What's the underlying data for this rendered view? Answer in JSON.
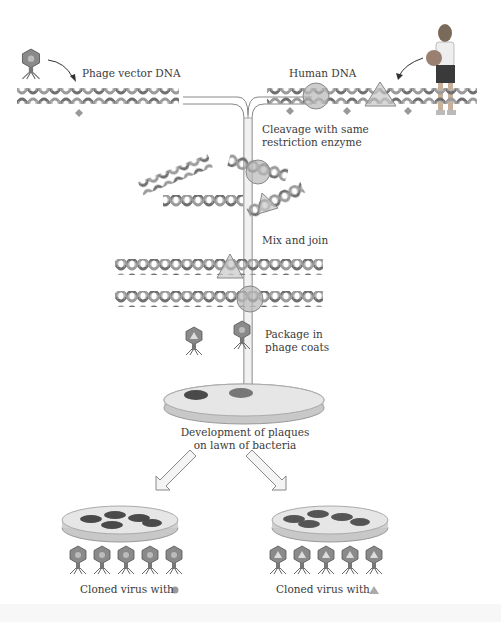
{
  "labels": {
    "phage_vector_dna": "Phage vector DNA",
    "human_dna": "Human DNA",
    "cleavage_line1": "Cleavage with same",
    "cleavage_line2": "restriction enzyme",
    "mix_and_join": "Mix and join",
    "package_line1": "Package in",
    "package_line2": "phage coats",
    "plaques_line1": "Development of plaques",
    "plaques_line2": "on lawn of bacteria",
    "cloned_circle": "Cloned virus with",
    "cloned_triangle": "Cloned virus with"
  },
  "markers": {
    "circle_insert": "circle-insert",
    "triangle_insert": "triangle-insert"
  },
  "colors": {
    "dna_strand": "#8a8a8a",
    "dna_dark": "#5a5a5a",
    "insert_fill": "#b8b8b8",
    "plaque": "#4a4a4a",
    "dish": "#d8d8d8",
    "arrow_outline": "#888888"
  },
  "counts": {
    "cloned_phages_left": 5,
    "cloned_phages_right": 5
  }
}
